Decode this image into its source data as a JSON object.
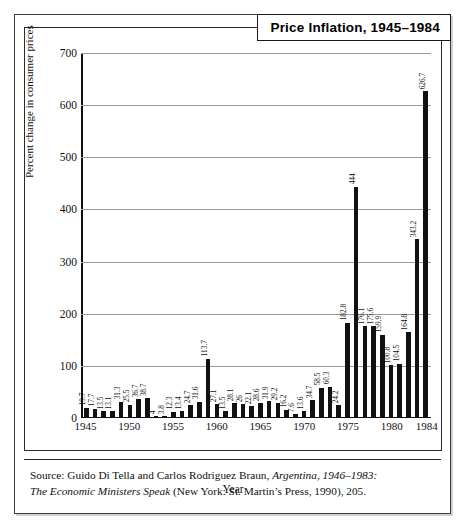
{
  "figure": {
    "title": "Price Inflation, 1945–1984",
    "source": {
      "line1_prefix": "Source: Guido Di Tella and Carlos Rodriguez Braun, ",
      "line1_italic": "Argentina, 1946–1983:",
      "line2_italic": "The Economic Ministers Speak",
      "line2_suffix": " (New York: St. Martin’s Press, 1990), 205."
    }
  },
  "chart_data": {
    "type": "bar",
    "title": "Price Inflation, 1945–1984",
    "xlabel": "Year",
    "ylabel": "Percent change in consumer prices",
    "ylim": [
      0,
      700
    ],
    "yticks": [
      0,
      100,
      200,
      300,
      400,
      500,
      600,
      700
    ],
    "grid": true,
    "legend": "none",
    "xtick_labels": [
      "1945",
      "1950",
      "1955",
      "1960",
      "1965",
      "1970",
      "1975",
      "1980",
      "1984"
    ],
    "xtick_years": [
      1945,
      1950,
      1955,
      1960,
      1965,
      1970,
      1975,
      1980,
      1984
    ],
    "categories": [
      "1945",
      "1946",
      "1947",
      "1948",
      "1949",
      "1950",
      "1951",
      "1952",
      "1953",
      "1954",
      "1955",
      "1956",
      "1957",
      "1958",
      "1959",
      "1960",
      "1961",
      "1962",
      "1963",
      "1964",
      "1965",
      "1966",
      "1967",
      "1968",
      "1969",
      "1970",
      "1971",
      "1972",
      "1973",
      "1974",
      "1975",
      "1976",
      "1977",
      "1978",
      "1979",
      "1980",
      "1981",
      "1982",
      "1983",
      "1984"
    ],
    "values": [
      19.7,
      17.7,
      13.5,
      13.1,
      31.3,
      25.5,
      36.7,
      38.7,
      4,
      3.8,
      12.3,
      13.4,
      24.7,
      31.6,
      113.7,
      27.1,
      13.5,
      28.1,
      26,
      22.1,
      28.6,
      31.9,
      29.2,
      16.2,
      7.6,
      13.6,
      34.7,
      58.5,
      60.3,
      24.2,
      182.8,
      444,
      176.1,
      175.6,
      159.9,
      100.8,
      104.5,
      164.8,
      343.2,
      626.7
    ],
    "value_labels": [
      "19.7",
      "17.7",
      "13.5",
      "13.1",
      "31.3",
      "25.5",
      "36.7",
      "38.7",
      "4",
      "3.8",
      "12.3",
      "13.4",
      "24.7",
      "31.6",
      "113.7",
      "27.1",
      "13.5",
      "28.1",
      "26",
      "22.1",
      "28.6",
      "31.9",
      "29.2",
      "16.2",
      "7.6",
      "13.6",
      "34.7",
      "58.5",
      "60.3",
      "24.2",
      "182.8",
      "444",
      "176.1",
      "175.6",
      "159.9",
      "100.8",
      "104.5",
      "164.8",
      "343.2",
      "626.7"
    ],
    "bar_color": "#111111",
    "gridline_color": "#9b9b9b"
  }
}
